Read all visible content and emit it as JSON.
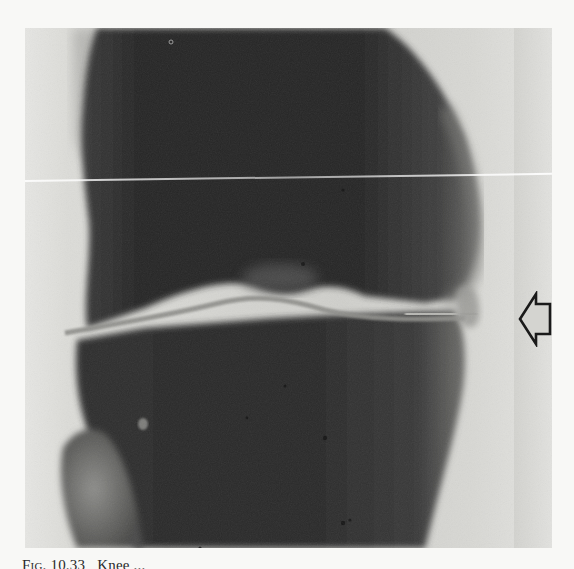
{
  "figure": {
    "type": "radiograph",
    "annotations": [
      {
        "kind": "arrow",
        "direction": "left",
        "style": "outlined",
        "target": "lateral joint space"
      }
    ],
    "colors": {
      "bone_dark": "#262626",
      "soft_tissue": "#d6d6d2",
      "joint_line": "#8a8a86",
      "arrow_stroke": "#1a1a1a"
    }
  },
  "caption": {
    "label": "Fig. 10.33",
    "text": "Knee ...",
    "partially_visible": true
  }
}
